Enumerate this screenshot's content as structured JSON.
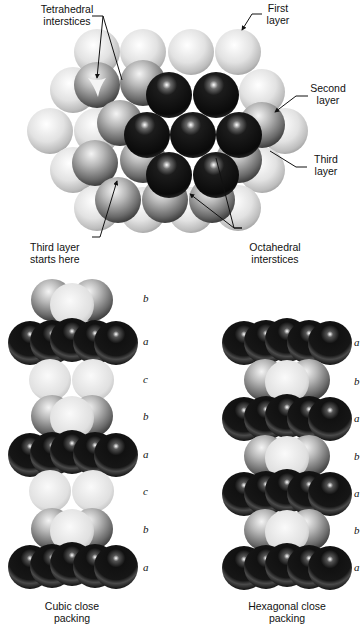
{
  "top_diagram": {
    "labels": {
      "tetrahedral": [
        "Tetrahedral",
        "interstices"
      ],
      "first_layer": [
        "First",
        "layer"
      ],
      "second_layer": [
        "Second",
        "layer"
      ],
      "third_layer": [
        "Third",
        "layer"
      ],
      "third_layer_starts": [
        "Third layer",
        "starts here"
      ],
      "octahedral": [
        "Octahedral",
        "interstices"
      ]
    },
    "layer_colors": {
      "first": "#e6e6e6",
      "second": "#8a8a8a",
      "third": "#1a1a1a"
    }
  },
  "cubic": {
    "caption": [
      "Cubic close",
      "packing"
    ],
    "sequence": [
      "b",
      "a",
      "c",
      "b",
      "a",
      "c",
      "b",
      "a"
    ]
  },
  "hexagonal": {
    "caption": [
      "Hexagonal close",
      "packing"
    ],
    "sequence": [
      "a",
      "b",
      "a",
      "b",
      "a",
      "b",
      "a"
    ]
  }
}
